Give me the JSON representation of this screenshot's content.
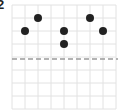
{
  "problem": {
    "number": "2"
  },
  "grid": {
    "origin_x": 12,
    "origin_y": 5,
    "cell": 13,
    "cols": 8,
    "rows": 8,
    "line_color": "#e2e2e2"
  },
  "mirror_line": {
    "y": 59,
    "style": "dashed",
    "color": "#9a9a9a"
  },
  "chart_data": {
    "type": "scatter",
    "title": "",
    "xlabel": "",
    "ylabel": "",
    "grid": true,
    "points": [
      {
        "col": 1,
        "row": 2
      },
      {
        "col": 2,
        "row": 1
      },
      {
        "col": 4,
        "row": 2
      },
      {
        "col": 4,
        "row": 3
      },
      {
        "col": 6,
        "row": 1
      },
      {
        "col": 7,
        "row": 2
      }
    ],
    "dot_color": "#222222",
    "annotations": [
      "dashed horizontal line between row 4 and row 5 (line of symmetry)"
    ]
  }
}
